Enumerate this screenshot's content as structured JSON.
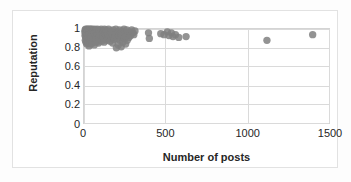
{
  "chart_data": {
    "type": "scatter",
    "title": "",
    "xlabel": "Number of posts",
    "ylabel": "Reputation",
    "xlim": [
      0,
      1500
    ],
    "ylim": [
      0,
      1
    ],
    "x_ticks": [
      "0",
      "500",
      "1000",
      "1500"
    ],
    "x_tick_values": [
      0,
      500,
      1000,
      1500
    ],
    "y_ticks": [
      "0",
      "0.2",
      "0.4",
      "0.6",
      "0.8",
      "1"
    ],
    "y_tick_values": [
      0,
      0.2,
      0.4,
      0.6,
      0.8,
      1
    ],
    "grid": "horizontal-and-vertical",
    "legend": "none",
    "marker_color": "#808080",
    "marker_size": 5,
    "series": [
      {
        "name": "users",
        "points": [
          [
            5,
            0.97
          ],
          [
            6,
            0.93
          ],
          [
            7,
            0.99
          ],
          [
            8,
            0.88
          ],
          [
            9,
            0.95
          ],
          [
            10,
            1.0
          ],
          [
            11,
            0.91
          ],
          [
            12,
            0.86
          ],
          [
            13,
            0.97
          ],
          [
            14,
            0.93
          ],
          [
            15,
            0.99
          ],
          [
            16,
            0.9
          ],
          [
            17,
            0.84
          ],
          [
            18,
            0.96
          ],
          [
            19,
            1.0
          ],
          [
            20,
            0.92
          ],
          [
            21,
            0.87
          ],
          [
            22,
            0.98
          ],
          [
            23,
            0.94
          ],
          [
            24,
            0.89
          ],
          [
            25,
            1.0
          ],
          [
            26,
            0.85
          ],
          [
            27,
            0.96
          ],
          [
            28,
            0.91
          ],
          [
            29,
            0.99
          ],
          [
            30,
            0.93
          ],
          [
            31,
            0.82
          ],
          [
            32,
            0.97
          ],
          [
            33,
            0.88
          ],
          [
            34,
            1.0
          ],
          [
            35,
            0.9
          ],
          [
            36,
            0.95
          ],
          [
            37,
            0.86
          ],
          [
            38,
            0.99
          ],
          [
            39,
            0.92
          ],
          [
            40,
            0.97
          ],
          [
            41,
            0.84
          ],
          [
            42,
            1.0
          ],
          [
            43,
            0.89
          ],
          [
            44,
            0.94
          ],
          [
            45,
            0.91
          ],
          [
            46,
            0.98
          ],
          [
            47,
            0.87
          ],
          [
            48,
            0.96
          ],
          [
            49,
            0.93
          ],
          [
            50,
            1.0
          ],
          [
            52,
            0.85
          ],
          [
            54,
            0.9
          ],
          [
            55,
            0.97
          ],
          [
            57,
            0.92
          ],
          [
            58,
            0.99
          ],
          [
            60,
            0.88
          ],
          [
            62,
            0.95
          ],
          [
            63,
            0.83
          ],
          [
            65,
            1.0
          ],
          [
            67,
            0.91
          ],
          [
            68,
            0.96
          ],
          [
            70,
            0.87
          ],
          [
            72,
            0.93
          ],
          [
            74,
            0.99
          ],
          [
            75,
            0.9
          ],
          [
            77,
            0.86
          ],
          [
            79,
            0.97
          ],
          [
            80,
            0.94
          ],
          [
            82,
            1.0
          ],
          [
            84,
            0.89
          ],
          [
            85,
            0.92
          ],
          [
            87,
            0.98
          ],
          [
            89,
            0.85
          ],
          [
            90,
            0.95
          ],
          [
            92,
            0.91
          ],
          [
            95,
            0.99
          ],
          [
            97,
            0.88
          ],
          [
            100,
            0.96
          ],
          [
            103,
            0.93
          ],
          [
            105,
            1.0
          ],
          [
            108,
            0.87
          ],
          [
            110,
            0.94
          ],
          [
            113,
            0.9
          ],
          [
            115,
            0.98
          ],
          [
            118,
            0.92
          ],
          [
            120,
            0.97
          ],
          [
            123,
            0.86
          ],
          [
            125,
            1.0
          ],
          [
            128,
            0.91
          ],
          [
            130,
            0.95
          ],
          [
            133,
            0.89
          ],
          [
            135,
            0.99
          ],
          [
            138,
            0.93
          ],
          [
            140,
            0.88
          ],
          [
            145,
            0.96
          ],
          [
            148,
            0.92
          ],
          [
            150,
            1.0
          ],
          [
            155,
            0.9
          ],
          [
            158,
            0.94
          ],
          [
            160,
            0.87
          ],
          [
            165,
            0.98
          ],
          [
            168,
            0.91
          ],
          [
            170,
            0.95
          ],
          [
            175,
            0.85
          ],
          [
            178,
            0.99
          ],
          [
            180,
            0.93
          ],
          [
            185,
            0.89
          ],
          [
            188,
            0.96
          ],
          [
            190,
            0.92
          ],
          [
            195,
            1.0
          ],
          [
            198,
            0.8
          ],
          [
            200,
            0.94
          ],
          [
            205,
            0.9
          ],
          [
            208,
            0.97
          ],
          [
            210,
            0.83
          ],
          [
            215,
            0.93
          ],
          [
            218,
            0.99
          ],
          [
            220,
            0.88
          ],
          [
            225,
            0.95
          ],
          [
            228,
            0.81
          ],
          [
            230,
            0.91
          ],
          [
            235,
            0.98
          ],
          [
            238,
            0.86
          ],
          [
            240,
            0.94
          ],
          [
            245,
            1.0
          ],
          [
            248,
            0.9
          ],
          [
            250,
            0.96
          ],
          [
            255,
            0.84
          ],
          [
            258,
            0.92
          ],
          [
            262,
            0.99
          ],
          [
            265,
            0.88
          ],
          [
            270,
            0.95
          ],
          [
            275,
            0.91
          ],
          [
            280,
            0.97
          ],
          [
            285,
            0.93
          ],
          [
            292,
            0.99
          ],
          [
            300,
            0.96
          ],
          [
            305,
            0.94
          ],
          [
            312,
            0.98
          ],
          [
            395,
            0.96
          ],
          [
            400,
            0.9
          ],
          [
            470,
            0.95
          ],
          [
            490,
            0.94
          ],
          [
            510,
            0.97
          ],
          [
            520,
            0.93
          ],
          [
            535,
            0.96
          ],
          [
            545,
            0.92
          ],
          [
            560,
            0.94
          ],
          [
            580,
            0.91
          ],
          [
            625,
            0.92
          ],
          [
            1120,
            0.88
          ],
          [
            1400,
            0.94
          ]
        ]
      }
    ]
  },
  "axes": {
    "x_title": "Number of posts",
    "y_title": "Reputation"
  }
}
